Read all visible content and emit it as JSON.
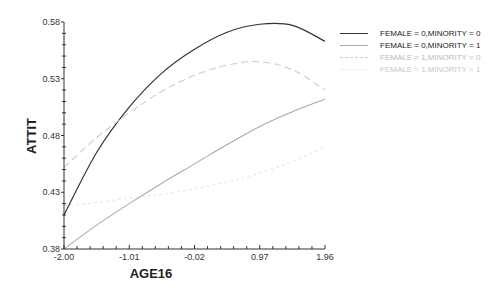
{
  "chart_data": {
    "type": "line",
    "title": "",
    "xlabel": "AGE16",
    "ylabel": "ATTIT",
    "xlim": [
      -2.0,
      1.96
    ],
    "ylim": [
      0.38,
      0.58
    ],
    "x_ticks": [
      "-2.00",
      "-1.01",
      "-0.02",
      "0.97",
      "1.96"
    ],
    "y_ticks": [
      "0.38",
      "0.43",
      "0.48",
      "0.53",
      "0.58"
    ],
    "grid": false,
    "legend_position": "right-top",
    "x": [
      -2.0,
      -1.505,
      -1.01,
      -0.515,
      -0.02,
      0.475,
      0.97,
      1.465,
      1.96
    ],
    "series": [
      {
        "name": "FEMALE = 0,MINORITY = 0",
        "color": "#333333",
        "dash": "solid",
        "values": [
          0.41,
          0.465,
          0.505,
          0.535,
          0.556,
          0.571,
          0.578,
          0.577,
          0.563
        ]
      },
      {
        "name": "FEMALE = 0,MINORITY = 1",
        "color": "#aaaaaa",
        "dash": "solid",
        "values": [
          0.38,
          0.401,
          0.42,
          0.438,
          0.455,
          0.472,
          0.488,
          0.501,
          0.512
        ]
      },
      {
        "name": "FEMALE = 1,MINORITY = 0",
        "color": "#cccccc",
        "dash": "dashed",
        "values": [
          0.452,
          0.478,
          0.5,
          0.519,
          0.533,
          0.542,
          0.545,
          0.538,
          0.52
        ]
      },
      {
        "name": "FEMALE = 1,MINORITY = 1",
        "color": "#e6e6e6",
        "dash": "dotted",
        "values": [
          0.418,
          0.421,
          0.425,
          0.428,
          0.433,
          0.439,
          0.447,
          0.457,
          0.47
        ]
      }
    ]
  },
  "legend": {
    "items": [
      {
        "label": "FEMALE = 0,MINORITY = 0",
        "color": "#222222"
      },
      {
        "label": "FEMALE = 0,MINORITY = 1",
        "color": "#222222"
      },
      {
        "label": "FEMALE = 1,MINORITY = 0",
        "color": "#bbbbbb"
      },
      {
        "label": "FEMALE = 1,MINORITY = 1",
        "color": "#c8c8c8"
      }
    ]
  }
}
